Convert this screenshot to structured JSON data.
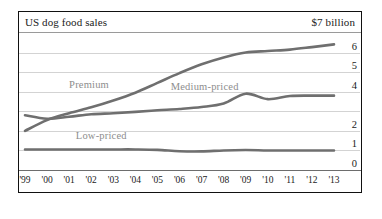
{
  "header": {
    "title": "US dog food sales",
    "unit": "$7 billion"
  },
  "chart_data": {
    "type": "line",
    "title": "US dog food sales",
    "subtitle": "$7 billion",
    "xlabel": "",
    "ylabel": "$ billion",
    "xlim": [
      1999,
      2013
    ],
    "ylim": [
      0,
      7
    ],
    "grid": true,
    "legend": "inline-labels",
    "x": [
      1999,
      2000,
      2001,
      2002,
      2003,
      2004,
      2005,
      2006,
      2007,
      2008,
      2009,
      2010,
      2011,
      2012,
      2013
    ],
    "categories": [
      "'99",
      "'00",
      "'01",
      "'02",
      "'03",
      "'04",
      "'05",
      "'06",
      "'07",
      "'08",
      "'09",
      "'10",
      "'11",
      "'12",
      "'13"
    ],
    "ytick_labels": [
      "6",
      "5",
      "4",
      "",
      "2",
      "1",
      "0"
    ],
    "ytick_values": [
      6,
      5,
      4,
      3,
      2,
      1,
      0
    ],
    "series": [
      {
        "name": "Premium",
        "color": "#6f6f6f",
        "values": [
          2.0,
          2.55,
          2.9,
          3.2,
          3.55,
          3.95,
          4.45,
          4.95,
          5.4,
          5.75,
          6.0,
          6.08,
          6.15,
          6.28,
          6.42
        ]
      },
      {
        "name": "Medium-priced",
        "color": "#6f6f6f",
        "values": [
          2.8,
          2.62,
          2.72,
          2.85,
          2.9,
          2.97,
          3.05,
          3.12,
          3.22,
          3.4,
          3.9,
          3.62,
          3.78,
          3.8,
          3.8
        ]
      },
      {
        "name": "Low-priced",
        "color": "#8a8a8a",
        "values": [
          1.05,
          1.05,
          1.05,
          1.05,
          1.05,
          1.05,
          1.03,
          0.96,
          0.95,
          1.0,
          1.02,
          1.0,
          1.0,
          1.0,
          1.0
        ]
      }
    ],
    "annotations": [
      {
        "text": "Premium",
        "x": 2001.0,
        "y": 4.35
      },
      {
        "text": "Medium-priced",
        "x": 2005.6,
        "y": 4.25
      },
      {
        "text": "Low-priced",
        "x": 2001.3,
        "y": 1.72
      }
    ]
  }
}
